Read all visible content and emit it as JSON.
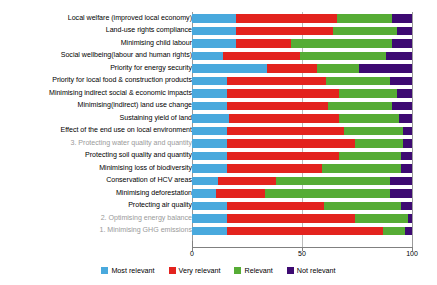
{
  "chart_data": {
    "type": "bar",
    "orientation": "horizontal",
    "stacked": true,
    "stack_mode": "percent",
    "title": "",
    "subtitle": "",
    "xlabel": "",
    "ylabel": "",
    "xlim": [
      0,
      100
    ],
    "xticks": [
      0,
      50,
      100
    ],
    "xtick_labels": [
      "0",
      "50",
      "100"
    ],
    "grid": true,
    "grid_axis": "x",
    "legend_position": "bottom",
    "legend": [
      "Most relevant",
      "Very relevant",
      "Relevant",
      "Not relevant"
    ],
    "colors": {
      "most_relevant": "#49a9dd",
      "very_relevant": "#e3231e",
      "relevant": "#56ac35",
      "not_relevant": "#3d0a72"
    },
    "categories": [
      "Local welfare (improved local economy)",
      "Land-use rights compliance",
      "Minimising child labour",
      "Social wellbeing(labour and human rights)",
      "Priority for energy security",
      "Priority for local food & construction products",
      "Minimising indirect social & economic impacts",
      "Minimising(indirect) land use change",
      "Sustaining yield of land",
      "Effect of the end use on local environment",
      "3. Protecting water quality and quantity",
      "Protecting soil quality and quantity",
      "Minimising loss of biodiversity",
      "Conservation of HCV areas",
      "Minimising deforestation",
      "Protecting air quality",
      "2. Optimising energy balance",
      "1. Minimising GHG emissions"
    ],
    "series": [
      {
        "name": "Most relevant",
        "color": "#49a9dd",
        "values": [
          20,
          20,
          20,
          14,
          34,
          16,
          16,
          16,
          17,
          16,
          16,
          16,
          16,
          12,
          11,
          16,
          16,
          16
        ]
      },
      {
        "name": "Very relevant",
        "color": "#e3231e",
        "values": [
          46,
          44,
          25,
          35,
          23,
          45,
          51,
          46,
          50,
          53,
          58,
          51,
          43,
          26,
          22,
          44,
          58,
          71
        ]
      },
      {
        "name": "Relevant",
        "color": "#56ac35",
        "values": [
          25,
          29,
          46,
          39,
          19,
          29,
          26,
          29,
          27,
          27,
          22,
          28,
          36,
          52,
          57,
          35,
          24,
          10
        ]
      },
      {
        "name": "Not relevant",
        "color": "#3d0a72",
        "values": [
          9,
          7,
          9,
          12,
          24,
          10,
          7,
          9,
          6,
          4,
          4,
          5,
          5,
          10,
          10,
          5,
          2,
          3
        ]
      }
    ],
    "highlighted_categories": [
      "3. Protecting water quality and quantity",
      "2. Optimising energy balance",
      "1. Minimising GHG emissions"
    ],
    "highlight_color": "#9a9a9a"
  }
}
